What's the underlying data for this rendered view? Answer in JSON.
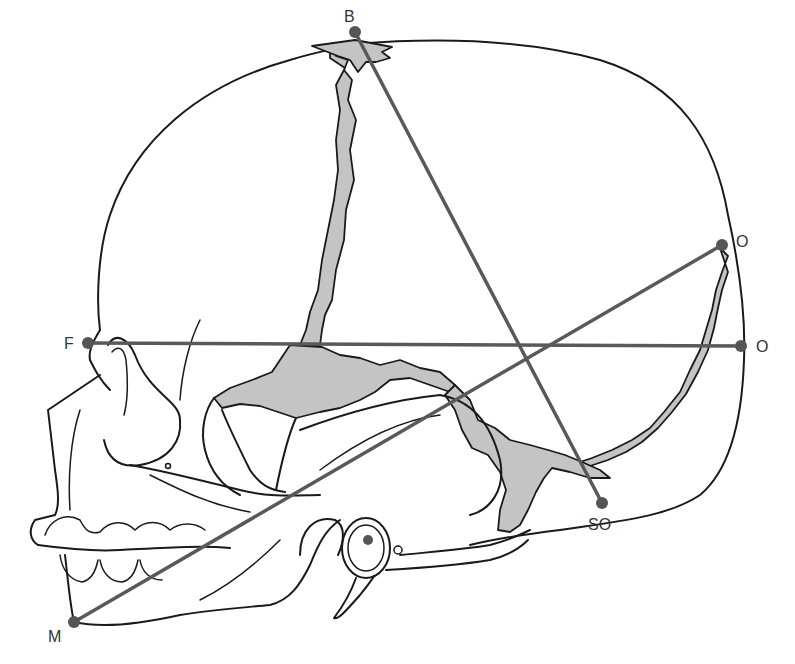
{
  "figure": {
    "colors": {
      "outline": "#1a1a1a",
      "measurement_line": "#595959",
      "landmark_point": "#555555",
      "fontanelle_fill": "#c4c4c4",
      "label_text": "#333333",
      "background": "#ffffff"
    }
  },
  "landmarks": [
    {
      "id": "B",
      "label": "B",
      "x": 355,
      "y": 32,
      "label_x": 344,
      "label_y": 22
    },
    {
      "id": "O_upper",
      "label": "O",
      "x": 722,
      "y": 245,
      "label_x": 736,
      "label_y": 247
    },
    {
      "id": "F",
      "label": "F",
      "x": 88,
      "y": 343,
      "label_x": 64,
      "label_y": 349
    },
    {
      "id": "O_lower",
      "label": "O",
      "x": 741,
      "y": 346,
      "label_x": 756,
      "label_y": 352
    },
    {
      "id": "SO",
      "label": "SO",
      "x": 602,
      "y": 503,
      "label_x": 588,
      "label_y": 530
    },
    {
      "id": "M",
      "label": "M",
      "x": 74,
      "y": 622,
      "label_x": 48,
      "label_y": 642
    }
  ],
  "measurement_lines": [
    {
      "name": "bregma-to-suboccipital",
      "from": "B",
      "to": "SO"
    },
    {
      "name": "fronto-occipital",
      "from": "F",
      "to": "O_lower"
    },
    {
      "name": "mento-occipital",
      "from": "M",
      "to": "O_upper"
    }
  ]
}
